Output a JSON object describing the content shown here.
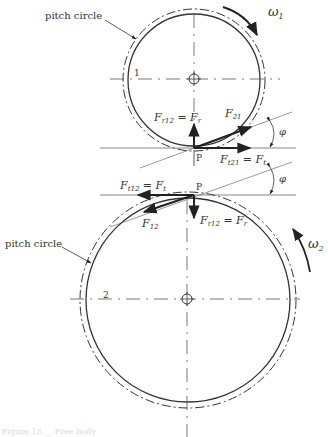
{
  "diagram": {
    "labels": {
      "pitch_circle_top": "pitch circle",
      "pitch_circle_bottom": "pitch circle",
      "gear1": "1",
      "gear2": "2",
      "omega1": "ω",
      "omega1_sub": "1",
      "omega2": "ω",
      "omega2_sub": "2",
      "pitch_point_top": "P",
      "pitch_point_bottom": "P",
      "phi_top": "φ",
      "phi_bottom": "φ",
      "Fr12_top_main": "F",
      "Fr12_top_sub": "r12",
      "Fr12_top_eq": " = F",
      "Fr12_top_eqsub": "r",
      "F21_main": "F",
      "F21_sub": "21",
      "Ft21_main": "F",
      "Ft21_sub": "t21",
      "Ft21_eq": " = F",
      "Ft21_eqsub": "t",
      "Ft12_main": "F",
      "Ft12_sub": "t12",
      "Ft12_eq": " = F",
      "Ft12_eqsub": "t",
      "F12_main": "F",
      "F12_sub": "12",
      "Fr12_bot_main": "F",
      "Fr12_bot_sub": "r12",
      "Fr12_bot_eq": " = F",
      "Fr12_bot_eqsub": "r"
    },
    "caption": "Figure 13.__ Free body"
  },
  "colors": {
    "line": "#333333",
    "thin": "#555555",
    "arrow": "#222222"
  }
}
